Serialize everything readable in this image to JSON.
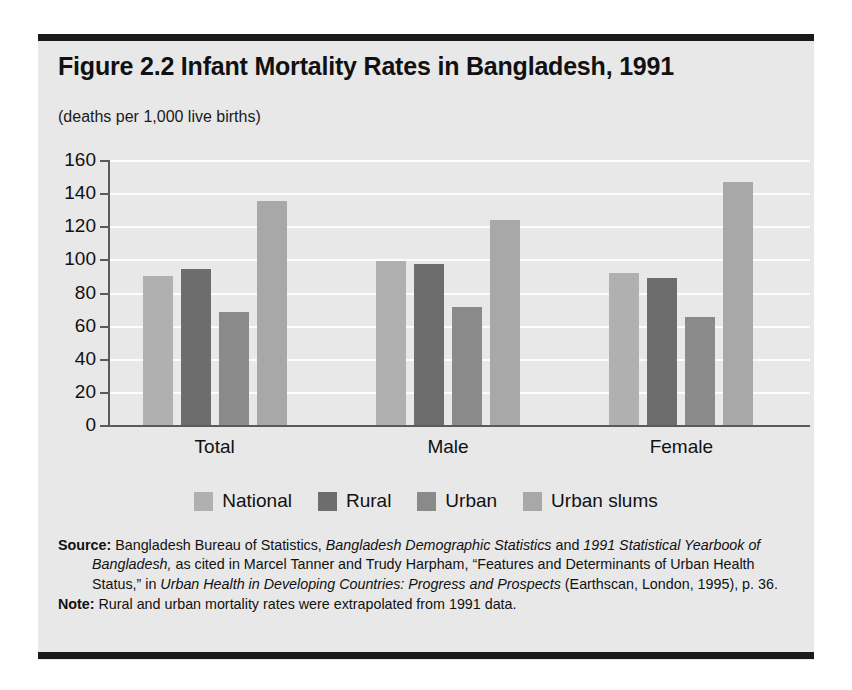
{
  "figure": {
    "title": "Figure 2.2  Infant Mortality Rates in Bangladesh, 1991",
    "subtitle": "(deaths per 1,000 live births)"
  },
  "notes": {
    "source_label": "Source:",
    "source_text_1": " Bangladesh Bureau of Statistics, ",
    "source_italic_1": "Bangladesh Demographic Statistics",
    "source_text_2": " and ",
    "source_italic_2": "1991 Statistical Yearbook of Bangladesh,",
    "source_text_3": " as cited in Marcel Tanner and Trudy Harpham, “Features and Determinants of Urban Health Status,” in ",
    "source_italic_3": "Urban Health in Developing Countries: Progress and Prospects",
    "source_text_4": " (Earthscan, London, 1995), p. 36.",
    "note_label": "Note:",
    "note_text": " Rural and urban mortality rates were extrapolated from 1991 data."
  },
  "colors": {
    "panel_background": "#e8e8e8",
    "rule": "#1a1a1a",
    "axis": "#5a5a5a",
    "gridline": "#fcfcfc",
    "national": "#b0b0b0",
    "rural": "#6d6d6d",
    "urban": "#8a8a8a",
    "urban_slums": "#a8a8a8"
  },
  "chart_data": {
    "type": "bar",
    "title": "Figure 2.2  Infant Mortality Rates in Bangladesh, 1991",
    "subtitle": "(deaths per 1,000 live births)",
    "xlabel": "",
    "ylabel": "(deaths per 1,000 live births)",
    "ylim": [
      0,
      160
    ],
    "ytick_step": 20,
    "yticks": [
      0,
      20,
      40,
      60,
      80,
      100,
      120,
      140,
      160
    ],
    "ytick_labels": [
      "0",
      "20",
      "40",
      "60",
      "80",
      "100",
      "120",
      "140",
      "160"
    ],
    "grid": true,
    "legend_position": "bottom",
    "categories": [
      "Total",
      "Male",
      "Female"
    ],
    "series": [
      {
        "name": "National",
        "color": "#b0b0b0",
        "values": [
          90,
          99,
          92
        ]
      },
      {
        "name": "Rural",
        "color": "#6d6d6d",
        "values": [
          94,
          97,
          89
        ]
      },
      {
        "name": "Urban",
        "color": "#8a8a8a",
        "values": [
          68,
          71,
          65
        ]
      },
      {
        "name": "Urban slums",
        "color": "#a8a8a8",
        "values": [
          135,
          124,
          147
        ]
      }
    ]
  }
}
